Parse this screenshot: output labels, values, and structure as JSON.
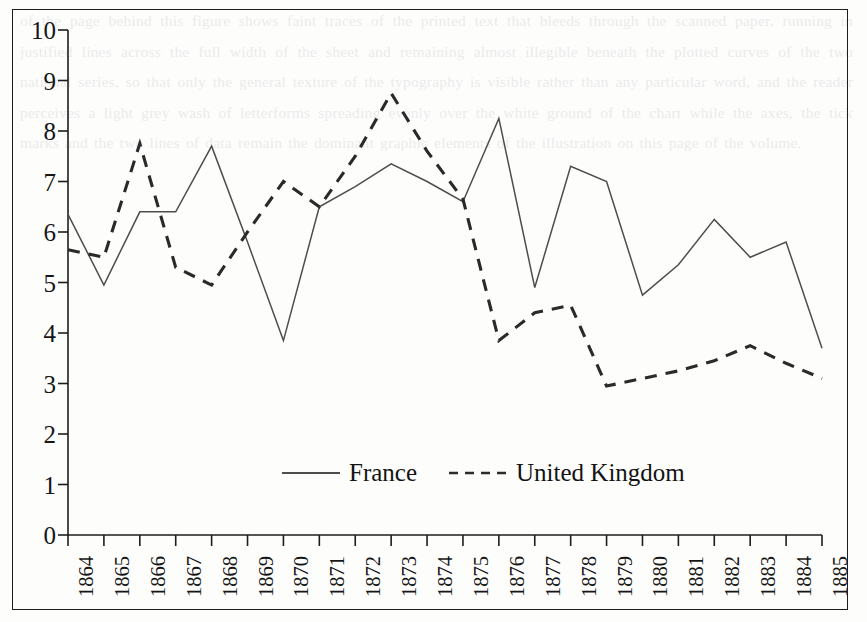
{
  "figure": {
    "background_color": "#fdfdfc",
    "frame_color": "#1d1d1d"
  },
  "chart_data": {
    "type": "line",
    "title": "",
    "subtitle": "",
    "xlabel": "",
    "ylabel": "",
    "xlim": [
      1864,
      1885
    ],
    "ylim": [
      0,
      10
    ],
    "grid": false,
    "legend_position": "bottom-center",
    "x": [
      1864,
      1865,
      1866,
      1867,
      1868,
      1869,
      1870,
      1871,
      1872,
      1873,
      1874,
      1875,
      1876,
      1877,
      1878,
      1879,
      1880,
      1881,
      1882,
      1883,
      1884,
      1885
    ],
    "categories": [
      "1864",
      "1865",
      "1866",
      "1867",
      "1868",
      "1869",
      "1870",
      "1871",
      "1872",
      "1873",
      "1874",
      "1875",
      "1876",
      "1877",
      "1878",
      "1879",
      "1880",
      "1881",
      "1882",
      "1883",
      "1884",
      "1885"
    ],
    "y_ticks": [
      0,
      1,
      2,
      3,
      4,
      5,
      6,
      7,
      8,
      9,
      10
    ],
    "y_tick_labels": [
      "0",
      "1",
      "2",
      "3",
      "4",
      "5",
      "6",
      "7",
      "8",
      "9",
      "10"
    ],
    "series": [
      {
        "name": "France",
        "line_style": "solid",
        "color": "#4d4d4d",
        "values": [
          6.35,
          4.95,
          6.4,
          6.4,
          7.7,
          5.8,
          3.85,
          6.5,
          6.9,
          7.35,
          7.0,
          6.6,
          8.25,
          4.9,
          7.3,
          7.0,
          4.75,
          5.35,
          6.25,
          5.5,
          5.8,
          3.7
        ]
      },
      {
        "name": "United Kingdom",
        "line_style": "dashed",
        "color": "#2a2a2a",
        "values": [
          5.65,
          5.5,
          7.75,
          5.3,
          4.95,
          6.0,
          7.0,
          6.5,
          7.5,
          8.75,
          7.6,
          6.65,
          3.85,
          4.4,
          4.55,
          2.95,
          3.1,
          3.25,
          3.45,
          3.75,
          3.4,
          3.1
        ]
      }
    ]
  },
  "legend": {
    "entries": [
      {
        "label": "France",
        "style": "solid"
      },
      {
        "label": "United Kingdom",
        "style": "dashed"
      }
    ]
  },
  "page_bleed": {
    "text": "of the page behind this figure shows faint traces of the printed text that bleeds through the scanned paper, running in justified lines across the full width of the sheet and remaining almost illegible beneath the plotted curves of the two national series, so that only the general texture of the typography is visible rather than any particular word, and the reader perceives a light grey wash of letterforms spreading evenly over the white ground of the chart while the axes, the tick marks and the two lines of data remain the dominant graphic elements of the illustration on this page of the volume."
  }
}
